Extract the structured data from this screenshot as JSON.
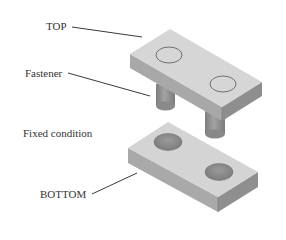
{
  "diagram": {
    "type": "exploded-isometric-assembly",
    "labels": {
      "top": "TOP",
      "fastener": "Fastener",
      "fixed_condition": "Fixed condition",
      "bottom": "BOTTOM"
    },
    "components": [
      {
        "id": "top-block",
        "label": "TOP",
        "holes": 2
      },
      {
        "id": "fasteners",
        "label": "Fastener",
        "count": 2
      },
      {
        "id": "bottom-block",
        "label": "BOTTOM",
        "holes": 2,
        "condition": "Fixed condition"
      }
    ],
    "colors": {
      "top_face": "#d6d6d6",
      "left_face": "#a9a9a9",
      "right_face": "#8f8f8f",
      "hole_fill": "#8a8a8a",
      "hole_outline": "#555555",
      "leader_line": "#3a3a3a",
      "text": "#333333"
    }
  }
}
